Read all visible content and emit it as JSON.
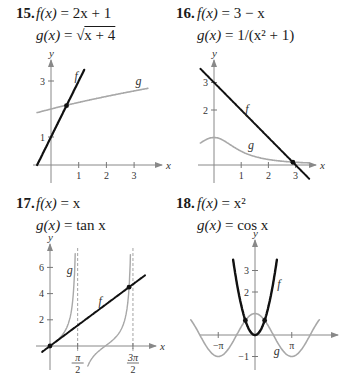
{
  "problems": [
    {
      "number": "15.",
      "f_label": "f(x) = 2x + 1",
      "g_label": "g(x) = √(x + 4)",
      "f_def": {
        "name": "f(x)",
        "rhs": "2x + 1"
      },
      "g_def": {
        "name": "g(x)",
        "rhs": "x + 4",
        "sqrt": true
      }
    },
    {
      "number": "16.",
      "f_def": {
        "name": "f(x)",
        "rhs": "3 − x"
      },
      "g_def": {
        "name": "g(x)",
        "rhs": "1/(x² + 1)"
      }
    },
    {
      "number": "17.",
      "f_def": {
        "name": "f(x)",
        "rhs": "x"
      },
      "g_def": {
        "name": "g(x)",
        "rhs": "tan x"
      }
    },
    {
      "number": "18.",
      "f_def": {
        "name": "f(x)",
        "rhs": "x²"
      },
      "g_def": {
        "name": "g(x)",
        "rhs": "cos x"
      }
    }
  ],
  "chart_data": [
    {
      "type": "line",
      "title": "15. f(x) = 2x + 1, g(x) = √(x + 4)",
      "xlabel": "x",
      "ylabel": "y",
      "xlim": [
        -0.5,
        3.5
      ],
      "ylim": [
        -0.3,
        3.4
      ],
      "xticks": [
        {
          "v": 1,
          "label": "1"
        },
        {
          "v": 2,
          "label": "2"
        },
        {
          "v": 3,
          "label": "3"
        }
      ],
      "yticks": [
        {
          "v": 1,
          "label": "1"
        },
        {
          "v": 3,
          "label": "3"
        }
      ],
      "series": [
        {
          "name": "f",
          "expr": "2x+1",
          "domain": [
            -0.5,
            1.2
          ],
          "color": "#111111",
          "width": 2.2,
          "label_at": [
            0.85,
            3.05
          ]
        },
        {
          "name": "g",
          "expr": "sqrt(x+4)",
          "domain": [
            -0.5,
            3.5
          ],
          "color": "#a8a8a8",
          "width": 1.6,
          "label_at": [
            3.05,
            2.85
          ]
        }
      ],
      "intersections": [
        [
          0.56,
          2.12
        ]
      ],
      "asymptotes": []
    },
    {
      "type": "line",
      "title": "16. f(x) = 3 − x, g(x) = 1/(x² + 1)",
      "xlabel": "x",
      "ylabel": "y",
      "xlim": [
        -0.5,
        3.5
      ],
      "ylim": [
        -0.5,
        3.3
      ],
      "xticks": [
        {
          "v": 1,
          "label": "1"
        },
        {
          "v": 2,
          "label": "2"
        },
        {
          "v": 3,
          "label": "3"
        }
      ],
      "yticks": [
        {
          "v": 2,
          "label": "2"
        },
        {
          "v": 3,
          "label": "3"
        }
      ],
      "series": [
        {
          "name": "f",
          "expr": "3-x",
          "domain": [
            -0.5,
            3.5
          ],
          "color": "#111111",
          "width": 2.0,
          "label_at": [
            1.15,
            1.9
          ]
        },
        {
          "name": "g",
          "expr": "1/(x*x+1)",
          "domain": [
            -0.5,
            3.5
          ],
          "color": "#a8a8a8",
          "width": 1.6,
          "label_at": [
            1.25,
            0.6
          ]
        }
      ],
      "intersections": [
        [
          2.9,
          0.1
        ]
      ],
      "asymptotes": []
    },
    {
      "type": "line",
      "title": "17. f(x) = x, g(x) = tan x",
      "xlabel": "x",
      "ylabel": "y",
      "xlim": [
        -0.5,
        5.3
      ],
      "ylim": [
        -1.0,
        7.0
      ],
      "xticks": [
        {
          "v": 1.5708,
          "label_num": "π",
          "label_den": "2"
        },
        {
          "v": 4.7124,
          "label_num": "3π",
          "label_den": "2"
        }
      ],
      "yticks": [
        {
          "v": 2,
          "label": "2"
        },
        {
          "v": 4,
          "label": "4"
        },
        {
          "v": 6,
          "label": "6"
        }
      ],
      "series": [
        {
          "name": "f",
          "expr": "x",
          "domain": [
            -0.45,
            5.4
          ],
          "color": "#111111",
          "width": 2.0,
          "label_at": [
            2.75,
            3.15
          ]
        },
        {
          "name": "g",
          "expr": "tan(x)",
          "domain": [
            0.5,
            1.43
          ],
          "color": "#a8a8a8",
          "width": 1.4,
          "label_at": [
            0.95,
            5.5
          ]
        },
        {
          "name": "g",
          "expr": "tan(x)",
          "domain": [
            2.15,
            4.57
          ],
          "color": "#a8a8a8",
          "width": 1.4,
          "label_at": null
        }
      ],
      "intersections": [
        [
          0,
          0
        ],
        [
          4.49,
          4.49
        ]
      ],
      "asymptotes": [
        1.5708,
        4.7124
      ]
    },
    {
      "type": "line",
      "title": "18. f(x) = x², g(x) = cos x",
      "xlabel": "x",
      "ylabel": "y",
      "xlim": [
        -5.5,
        5.5
      ],
      "ylim": [
        -1.4,
        3.5
      ],
      "xticks": [
        {
          "v": -3.1416,
          "label": "−π"
        },
        {
          "v": 3.1416,
          "label": "π"
        }
      ],
      "yticks": [
        {
          "v": -1,
          "label": "−1"
        },
        {
          "v": 2,
          "label": "2"
        },
        {
          "v": 3,
          "label": "3"
        }
      ],
      "series": [
        {
          "name": "f",
          "expr": "x*x",
          "domain": [
            -1.87,
            1.87
          ],
          "color": "#111111",
          "width": 2.4,
          "label_at": [
            1.9,
            2.2
          ]
        },
        {
          "name": "g",
          "expr": "cos(x)",
          "domain": [
            -5.5,
            5.5
          ],
          "color": "#a8a8a8",
          "width": 1.6,
          "label_at": [
            1.6,
            -0.95
          ]
        }
      ],
      "intersections": [
        [
          -0.824,
          0.679
        ],
        [
          0.824,
          0.679
        ]
      ],
      "asymptotes": []
    }
  ]
}
